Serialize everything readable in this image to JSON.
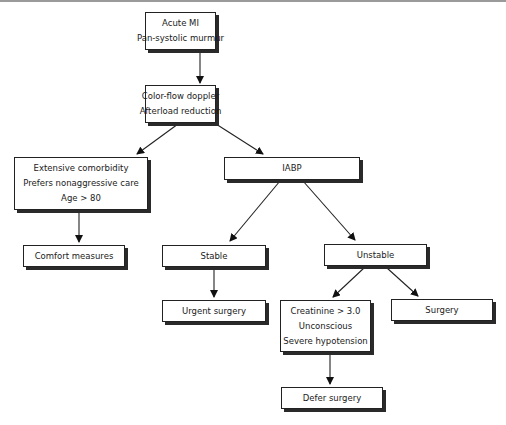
{
  "diagram": {
    "type": "flowchart",
    "nodes": {
      "acute_mi": {
        "lines": [
          "Acute MI",
          "Pan-systolic murmur"
        ]
      },
      "doppler": {
        "lines": [
          "Color-flow doppler",
          "Afterload reduction"
        ]
      },
      "comorbidity": {
        "lines": [
          "Extensive comorbidity",
          "Prefers nonaggressive care",
          "Age > 80"
        ]
      },
      "iabp": {
        "lines": [
          "IABP"
        ]
      },
      "comfort": {
        "lines": [
          "Comfort measures"
        ]
      },
      "stable": {
        "lines": [
          "Stable"
        ]
      },
      "unstable": {
        "lines": [
          "Unstable"
        ]
      },
      "urgent_surgery": {
        "lines": [
          "Urgent surgery"
        ]
      },
      "contraindications": {
        "lines": [
          "Creatinine > 3.0",
          "Unconscious",
          "Severe hypotension"
        ]
      },
      "surgery": {
        "lines": [
          "Surgery"
        ]
      },
      "defer_surgery": {
        "lines": [
          "Defer surgery"
        ]
      }
    },
    "edges": [
      [
        "acute_mi",
        "doppler"
      ],
      [
        "doppler",
        "comorbidity"
      ],
      [
        "doppler",
        "iabp"
      ],
      [
        "comorbidity",
        "comfort"
      ],
      [
        "iabp",
        "stable"
      ],
      [
        "iabp",
        "unstable"
      ],
      [
        "stable",
        "urgent_surgery"
      ],
      [
        "unstable",
        "contraindications"
      ],
      [
        "unstable",
        "surgery"
      ],
      [
        "contraindications",
        "defer_surgery"
      ]
    ]
  }
}
